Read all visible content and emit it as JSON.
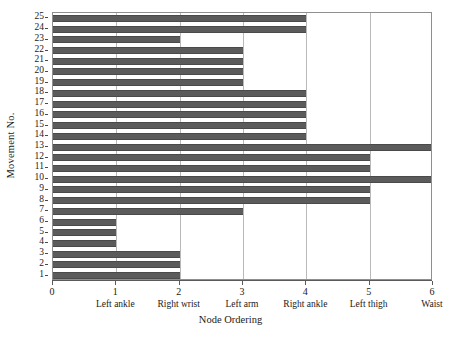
{
  "chart_data": {
    "type": "bar",
    "orientation": "horizontal",
    "title": "",
    "xlabel": "Node Ordering",
    "ylabel": "Movement No.",
    "xlim": [
      0,
      6
    ],
    "ylim": [
      0.5,
      25.5
    ],
    "grid": "vertical gridlines at each integer x tick",
    "legend": "none",
    "bar_color": "#5b5b5b",
    "categories": [
      1,
      2,
      3,
      4,
      5,
      6,
      7,
      8,
      9,
      10,
      11,
      12,
      13,
      14,
      15,
      16,
      17,
      18,
      19,
      20,
      21,
      22,
      23,
      24,
      25
    ],
    "values": [
      2,
      2,
      2,
      1,
      1,
      1,
      3,
      5,
      5,
      6,
      5,
      5,
      6,
      4,
      4,
      4,
      4,
      4,
      3,
      3,
      3,
      3,
      2,
      4,
      4
    ],
    "xticks": [
      {
        "value": 0,
        "number": "0",
        "name": ""
      },
      {
        "value": 1,
        "number": "1",
        "name": "Left ankle"
      },
      {
        "value": 2,
        "number": "2",
        "name": "Right wrist"
      },
      {
        "value": 3,
        "number": "3",
        "name": "Left arm"
      },
      {
        "value": 4,
        "number": "4",
        "name": "Right ankle"
      },
      {
        "value": 5,
        "number": "5",
        "name": "Left thigh"
      },
      {
        "value": 6,
        "number": "6",
        "name": "Waist"
      }
    ],
    "yticks": [
      "1",
      "2",
      "3",
      "4",
      "5",
      "6",
      "7",
      "8",
      "9",
      "10",
      "11",
      "12",
      "13",
      "14",
      "15",
      "16",
      "17",
      "18",
      "19",
      "20",
      "21",
      "22",
      "23",
      "24",
      "25"
    ]
  }
}
